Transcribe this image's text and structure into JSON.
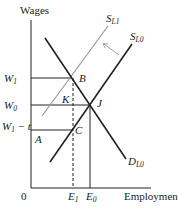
{
  "diagram": {
    "axes": {
      "y_label": "Wages",
      "x_label": "Employment",
      "origin_label": "0"
    },
    "wage_levels": [
      {
        "id": "W1",
        "label": "W",
        "sub": "1",
        "suffix": ""
      },
      {
        "id": "W0",
        "label": "W",
        "sub": "0",
        "suffix": ""
      },
      {
        "id": "W1-t",
        "label": "W",
        "sub": "1",
        "suffix": " − t"
      }
    ],
    "employment_levels": [
      {
        "id": "E1",
        "label": "E",
        "sub": "1"
      },
      {
        "id": "E0",
        "label": "E",
        "sub": "0"
      }
    ],
    "points": {
      "B": "B",
      "K": "K",
      "J": "J",
      "C": "C",
      "A": "A"
    },
    "curves": {
      "supply_new": {
        "label": "S",
        "sub": "L1",
        "color": "#9a9a9a"
      },
      "supply_old": {
        "label": "S",
        "sub": "L0",
        "color": "#222222"
      },
      "demand": {
        "label": "D",
        "sub": "L0",
        "color": "#222222"
      }
    },
    "shift_arrow": {
      "direction": "up-left",
      "color": "#9a9a9a"
    }
  }
}
